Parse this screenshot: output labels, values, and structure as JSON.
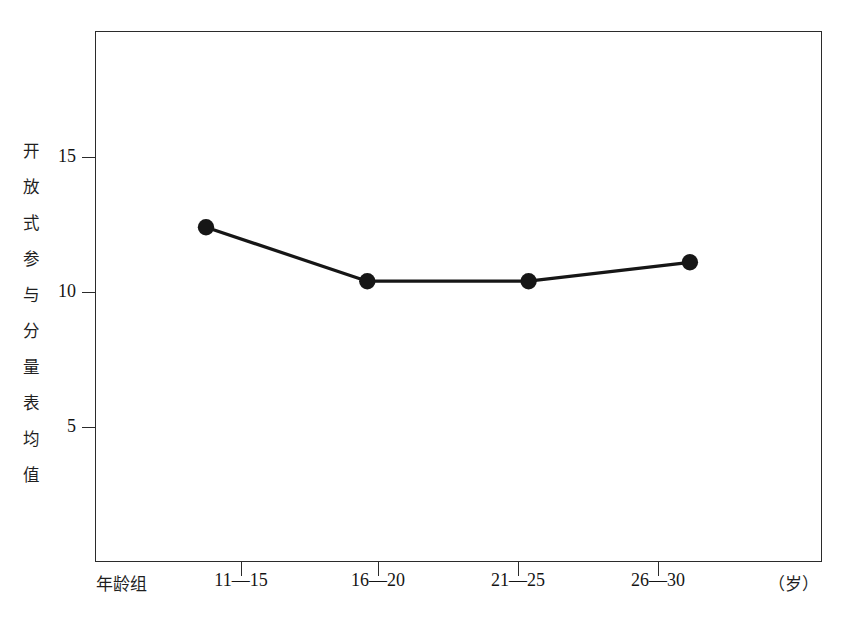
{
  "chart_data": {
    "type": "line",
    "title": "",
    "subtitle": "",
    "xlabel": "年龄组",
    "xunit": "（岁）",
    "ylabel": "开放式参与分量表均值",
    "categories": [
      "11—15",
      "16—20",
      "21—25",
      "26—30"
    ],
    "series": [
      {
        "name": "开放式参与分量表均值",
        "values": [
          12.4,
          10.4,
          10.4,
          11.1
        ]
      }
    ],
    "ytick_labels": [
      "15",
      "10",
      "5"
    ],
    "ytick_values": [
      15,
      10,
      5
    ],
    "ylim": [
      1.5,
      18.1
    ],
    "grid": false,
    "legend": "none",
    "marker": "filled-circle",
    "line_color": "#161616",
    "marker_color": "#161616",
    "frame_color": "#2b2b2b",
    "background": "#ffffff"
  },
  "axes": {
    "y_title_chars": [
      "开",
      "放",
      "式",
      "参",
      "与",
      "分",
      "量",
      "表",
      "均",
      "值"
    ],
    "y_title_text": "开\n放\n式\n参\n与\n分\n量\n表\n均\n值"
  }
}
